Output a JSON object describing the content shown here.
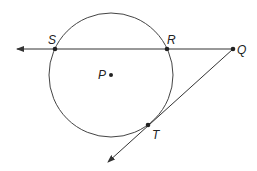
{
  "diagram": {
    "type": "circle with secant and tangent",
    "circle": {
      "center_label": "P",
      "cx": 111,
      "cy": 75,
      "r": 62
    },
    "points": [
      {
        "label": "S",
        "x": 55,
        "y": 49
      },
      {
        "label": "R",
        "x": 167,
        "y": 49
      },
      {
        "label": "Q",
        "x": 233,
        "y": 49
      },
      {
        "label": "P",
        "x": 111,
        "y": 75
      },
      {
        "label": "T",
        "x": 148,
        "y": 125
      }
    ],
    "lines": [
      {
        "name": "secant QS",
        "from": "Q",
        "through": [
          "R",
          "S"
        ],
        "arrow_end": [
          17,
          49
        ]
      },
      {
        "name": "tangent QT",
        "from": "Q",
        "through": [
          "T"
        ],
        "arrow_end": [
          108,
          162
        ]
      }
    ],
    "colors": {
      "stroke": "#333333",
      "background": "#ffffff"
    }
  }
}
